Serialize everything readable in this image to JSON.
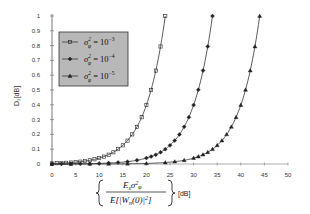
{
  "chart_data": {
    "type": "line",
    "title": "",
    "xlabel": "{ E_s σ²_φ / E[|W_n(0)|²] } [dB]",
    "ylabel": "D₂[dB]",
    "xlim": [
      0,
      50
    ],
    "ylim": [
      0,
      1
    ],
    "x_ticks": [
      "0",
      "5",
      "10",
      "15",
      "20",
      "25",
      "30",
      "35",
      "40",
      "45",
      "50"
    ],
    "y_ticks": [
      "0",
      "0.1",
      "0.2",
      "0.3",
      "0.4",
      "0.5",
      "0.6",
      "0.7",
      "0.8",
      "0.9",
      "1"
    ],
    "grid": false,
    "legend_position": "upper-left",
    "series": [
      {
        "name": "σ²_φ = 10⁻³",
        "marker": "square",
        "x": [
          0,
          1,
          2,
          3,
          4,
          5,
          6,
          7,
          8,
          9,
          10,
          11,
          12,
          13,
          14,
          15,
          16,
          17,
          18,
          19,
          20,
          21,
          22,
          23,
          24
        ],
        "values": [
          0.004,
          0.005,
          0.006,
          0.008,
          0.01,
          0.013,
          0.016,
          0.02,
          0.025,
          0.032,
          0.04,
          0.05,
          0.063,
          0.079,
          0.1,
          0.126,
          0.158,
          0.2,
          0.251,
          0.316,
          0.398,
          0.501,
          0.631,
          0.794,
          1.0
        ]
      },
      {
        "name": "σ²_φ = 10⁻⁴",
        "marker": "diamond",
        "x": [
          0,
          2,
          4,
          6,
          8,
          10,
          12,
          14,
          16,
          18,
          20,
          21,
          22,
          23,
          24,
          25,
          26,
          27,
          28,
          29,
          30,
          31,
          32,
          33,
          34
        ],
        "values": [
          0.0004,
          0.0006,
          0.001,
          0.0016,
          0.0025,
          0.004,
          0.006,
          0.01,
          0.016,
          0.025,
          0.04,
          0.05,
          0.063,
          0.079,
          0.1,
          0.126,
          0.158,
          0.2,
          0.251,
          0.316,
          0.398,
          0.501,
          0.631,
          0.794,
          1.0
        ]
      },
      {
        "name": "σ²_φ = 10⁻⁵",
        "marker": "triangle",
        "x": [
          0,
          4,
          8,
          12,
          16,
          20,
          24,
          26,
          28,
          30,
          31,
          32,
          33,
          34,
          35,
          36,
          37,
          38,
          39,
          40,
          41,
          42,
          43,
          44
        ],
        "values": [
          0.0,
          0.0001,
          0.0003,
          0.0006,
          0.0016,
          0.004,
          0.01,
          0.016,
          0.025,
          0.04,
          0.05,
          0.063,
          0.079,
          0.1,
          0.126,
          0.158,
          0.2,
          0.251,
          0.316,
          0.398,
          0.501,
          0.631,
          0.794,
          1.0
        ]
      }
    ]
  },
  "legend": {
    "items": [
      {
        "label": "σ",
        "sup": "2",
        "sub": "φ",
        "rhs": "= 10",
        "exp": "−3"
      },
      {
        "label": "σ",
        "sup": "2",
        "sub": "φ",
        "rhs": "= 10",
        "exp": "−4"
      },
      {
        "label": "σ",
        "sup": "2",
        "sub": "φ",
        "rhs": "= 10",
        "exp": "−5"
      }
    ]
  },
  "axis_labels": {
    "ylabel": "D₂[dB]",
    "x_numer": "E",
    "x_numer_sub": "s",
    "x_numer_sigma": "σ",
    "x_numer_sup": "2",
    "x_numer_phi": "φ",
    "x_denom": "E[|W",
    "x_denom_sub": "n",
    "x_denom_rest": "(0)|",
    "x_denom_sup": "2",
    "x_denom_close": "]",
    "x_unit": "[dB]"
  },
  "colors": {
    "line": "#333333",
    "legend_fill": "#b8b8b8",
    "axis": "#555555"
  }
}
